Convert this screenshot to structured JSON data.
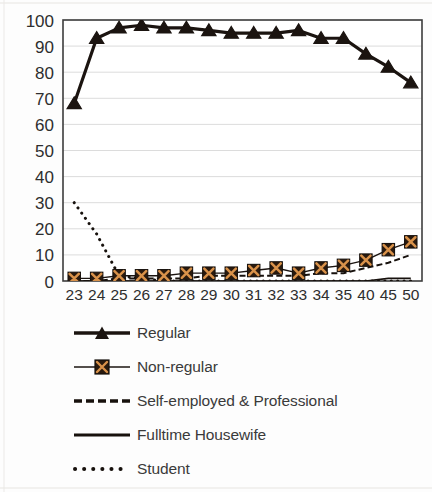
{
  "chart_data": {
    "type": "line",
    "title": "",
    "subtitle": "",
    "xlabel": "",
    "ylabel": "",
    "xlim": [
      0,
      15
    ],
    "ylim": [
      0,
      100
    ],
    "ytick_step": 10,
    "grid": true,
    "grid_axis": "y",
    "legend_position": "bottom",
    "categories": [
      "23",
      "24",
      "25",
      "26",
      "27",
      "28",
      "29",
      "30",
      "31",
      "32",
      "33",
      "34",
      "35",
      "40",
      "45",
      "50"
    ],
    "yticks": [
      "0",
      "10",
      "20",
      "30",
      "40",
      "50",
      "60",
      "70",
      "80",
      "90",
      "100"
    ],
    "series": [
      {
        "name": "Regular",
        "marker": "triangle",
        "line_style": "solid",
        "line_width": 3.2,
        "color": "#1b1410",
        "values": [
          68,
          93,
          97,
          98,
          97,
          97,
          96,
          95,
          95,
          95,
          96,
          93,
          93,
          87,
          82,
          76
        ]
      },
      {
        "name": "Non-regular",
        "marker": "x-square",
        "line_style": "solid",
        "line_width": 1.4,
        "color": "#1b1410",
        "marker_fill": "#2a1a0e",
        "marker_glyph_color": "#d9924a",
        "values": [
          1,
          1,
          2,
          2,
          2,
          3,
          3,
          3,
          4,
          5,
          3,
          5,
          6,
          8,
          12,
          15
        ]
      },
      {
        "name": "Self-employed & Professional",
        "marker": "none",
        "line_style": "dashed",
        "line_width": 2.0,
        "color": "#17110d",
        "values": [
          0,
          0,
          1,
          1,
          1,
          1,
          2,
          2,
          2,
          2,
          2,
          3,
          3,
          5,
          7,
          10
        ]
      },
      {
        "name": "Fulltime Housewife",
        "marker": "none",
        "line_style": "solid",
        "line_width": 1.6,
        "color": "#17110d",
        "values": [
          0,
          0,
          0,
          0,
          0,
          0,
          0,
          0,
          0,
          0,
          0,
          0,
          0,
          0,
          1,
          1
        ]
      },
      {
        "name": "Student",
        "marker": "none",
        "line_style": "dotted",
        "line_width": 3.0,
        "color": "#17110d",
        "values": [
          30,
          18,
          2,
          1,
          0,
          0,
          0,
          0,
          0,
          0,
          0,
          0,
          0,
          0,
          0,
          0
        ]
      }
    ]
  },
  "legend": {
    "items": [
      {
        "label": "Regular",
        "key": "line-triangle-marker"
      },
      {
        "label": "Non-regular",
        "key": "line-x-square-marker"
      },
      {
        "label": "Self-employed & Professional",
        "key": "dashed-line"
      },
      {
        "label": "Fulltime Housewife",
        "key": "solid-line"
      },
      {
        "label": "Student",
        "key": "dotted-line"
      }
    ]
  },
  "colors": {
    "axis": "#3d3d3d",
    "grid": "#d8d8d8",
    "tick_text": "#2e2e2e",
    "legend_text": "#3a3a3a",
    "series_dark": "#1b1410",
    "marker_accent": "#d9924a",
    "background": "#fdfdfd"
  }
}
